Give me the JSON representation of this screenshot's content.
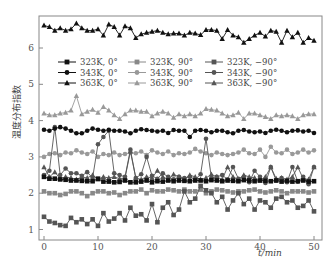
{
  "chart_data": {
    "type": "line",
    "title": "",
    "xlabel": "t/min",
    "ylabel": "温度分布指数",
    "xlim": [
      -2,
      51.5
    ],
    "ylim": [
      0.72,
      6.9
    ],
    "xticks": [
      0,
      10,
      20,
      30,
      40,
      50
    ],
    "yticks": [
      1,
      2,
      3,
      4,
      5,
      6
    ],
    "grid": false,
    "legend_position": "upper-center, 3 columns",
    "x": [
      0,
      1,
      2,
      3,
      4,
      5,
      6,
      7,
      8,
      9,
      10,
      11,
      12,
      13,
      14,
      15,
      16,
      17,
      18,
      19,
      20,
      21,
      22,
      23,
      24,
      25,
      26,
      27,
      28,
      29,
      30,
      31,
      32,
      33,
      34,
      35,
      36,
      37,
      38,
      39,
      40,
      41,
      42,
      43,
      44,
      45,
      46,
      47,
      48,
      49,
      50
    ],
    "series": [
      {
        "name": "323K, 0°",
        "color": "#111111",
        "marker": "square",
        "values": [
          2.45,
          2.4,
          2.4,
          2.38,
          2.37,
          2.35,
          2.35,
          2.34,
          2.33,
          2.33,
          2.4,
          2.32,
          2.32,
          2.3,
          2.31,
          2.35,
          2.3,
          2.3,
          2.32,
          2.35,
          2.3,
          2.33,
          2.32,
          2.35,
          2.33,
          2.35,
          2.34,
          2.33,
          2.35,
          2.35,
          2.33,
          2.36,
          2.35,
          2.33,
          2.35,
          2.34,
          2.33,
          2.36,
          2.35,
          2.33,
          2.35,
          2.34,
          2.33,
          2.35,
          2.32,
          2.34,
          2.32,
          2.33,
          2.35,
          2.32,
          2.33
        ]
      },
      {
        "name": "343K, 0°",
        "color": "#111111",
        "marker": "circle",
        "values": [
          3.75,
          3.72,
          3.78,
          3.82,
          3.78,
          3.72,
          3.65,
          3.65,
          3.72,
          3.78,
          3.75,
          3.72,
          3.75,
          3.72,
          3.72,
          3.7,
          3.65,
          3.72,
          3.76,
          3.74,
          3.72,
          3.7,
          3.72,
          3.66,
          3.74,
          3.72,
          3.72,
          3.55,
          3.72,
          3.74,
          3.72,
          3.68,
          3.72,
          3.72,
          3.68,
          3.65,
          3.72,
          3.74,
          3.7,
          3.68,
          3.7,
          3.66,
          3.72,
          3.75,
          3.72,
          3.68,
          3.72,
          3.73,
          3.7,
          3.72,
          3.66
        ]
      },
      {
        "name": "363K, 0°",
        "color": "#111111",
        "marker": "triangle",
        "values": [
          6.62,
          6.58,
          6.48,
          6.55,
          6.48,
          6.52,
          6.68,
          6.55,
          6.48,
          6.48,
          6.52,
          6.35,
          6.65,
          6.58,
          6.35,
          6.6,
          6.55,
          6.28,
          6.38,
          6.42,
          6.45,
          6.48,
          6.42,
          6.38,
          6.4,
          6.4,
          6.35,
          6.42,
          6.4,
          6.36,
          6.5,
          6.5,
          6.48,
          6.25,
          6.5,
          6.35,
          6.3,
          6.15,
          6.25,
          6.35,
          6.42,
          6.32,
          6.48,
          6.45,
          6.15,
          6.48,
          6.3,
          6.42,
          6.15,
          6.28,
          6.2
        ]
      },
      {
        "name": "323K, 90°",
        "color": "#888888",
        "marker": "square",
        "values": [
          2.05,
          2.0,
          2.0,
          1.95,
          1.98,
          2.05,
          2.05,
          2.0,
          1.92,
          2.0,
          2.05,
          2.05,
          2.0,
          2.02,
          1.95,
          2.0,
          2.05,
          2.05,
          2.1,
          2.0,
          2.08,
          2.05,
          2.05,
          2.1,
          2.08,
          2.05,
          2.1,
          2.05,
          2.05,
          2.1,
          2.0,
          2.05,
          2.1,
          2.08,
          2.05,
          2.02,
          2.05,
          2.05,
          2.08,
          2.1,
          2.05,
          2.02,
          2.05,
          2.08,
          2.05,
          2.0,
          2.05,
          2.05,
          2.05,
          2.02,
          2.05
        ]
      },
      {
        "name": "343K, 90°",
        "color": "#999999",
        "marker": "circle",
        "values": [
          3.0,
          3.08,
          3.1,
          3.05,
          3.12,
          3.1,
          3.18,
          3.12,
          3.08,
          3.15,
          3.0,
          3.08,
          3.05,
          3.12,
          3.05,
          3.08,
          3.12,
          3.1,
          3.15,
          3.05,
          3.18,
          3.12,
          3.08,
          3.15,
          3.05,
          3.1,
          3.08,
          3.12,
          3.22,
          3.15,
          3.1,
          3.05,
          3.12,
          3.08,
          3.05,
          3.08,
          3.12,
          3.2,
          3.1,
          3.08,
          3.2,
          3.0,
          3.28,
          3.12,
          3.1,
          3.2,
          3.08,
          3.12,
          3.2,
          3.12,
          3.18
        ]
      },
      {
        "name": "363K, 90°",
        "color": "#999999",
        "marker": "triangle",
        "values": [
          4.2,
          4.15,
          4.15,
          4.2,
          4.22,
          4.28,
          4.68,
          4.18,
          4.25,
          4.3,
          4.22,
          4.38,
          4.28,
          4.15,
          4.05,
          4.18,
          4.28,
          4.28,
          4.25,
          4.25,
          4.12,
          4.2,
          4.25,
          4.2,
          4.08,
          4.18,
          4.12,
          4.18,
          4.12,
          4.2,
          4.32,
          4.3,
          4.28,
          4.2,
          4.12,
          4.15,
          4.22,
          4.05,
          4.2,
          4.2,
          4.15,
          4.1,
          4.05,
          4.15,
          4.12,
          4.15,
          4.12,
          4.05,
          4.15,
          4.18,
          4.18
        ]
      },
      {
        "name": "323K, −90°",
        "color": "#555555",
        "marker": "square",
        "values": [
          1.35,
          1.22,
          1.18,
          1.12,
          1.1,
          1.32,
          1.2,
          1.28,
          1.15,
          1.28,
          1.1,
          1.45,
          1.22,
          1.3,
          1.45,
          1.25,
          1.6,
          1.38,
          1.42,
          1.25,
          1.7,
          1.2,
          1.6,
          1.75,
          1.4,
          1.55,
          2.05,
          1.75,
          1.85,
          2.2,
          2.08,
          2.0,
          1.75,
          1.9,
          1.55,
          1.8,
          2.0,
          1.7,
          1.85,
          1.55,
          1.8,
          1.75,
          1.6,
          1.85,
          1.9,
          1.75,
          1.8,
          1.6,
          1.65,
          1.8,
          1.5
        ]
      },
      {
        "name": "343K, −90°",
        "color": "#555555",
        "marker": "circle",
        "values": [
          2.5,
          2.62,
          3.82,
          2.5,
          2.68,
          2.55,
          2.55,
          2.48,
          2.58,
          2.42,
          3.35,
          3.55,
          3.72,
          2.55,
          2.5,
          2.45,
          3.2,
          2.42,
          2.52,
          3.0,
          2.48,
          2.4,
          2.55,
          2.45,
          2.38,
          2.45,
          2.42,
          2.45,
          2.38,
          2.52,
          3.5,
          2.42,
          2.45,
          2.5,
          2.38,
          2.72,
          2.4,
          2.45,
          2.3,
          2.62,
          2.45,
          2.28,
          2.72,
          2.35,
          2.42,
          2.3,
          2.72,
          2.32,
          2.45,
          2.25,
          2.72
        ]
      },
      {
        "name": "363K, −90°",
        "color": "#555555",
        "marker": "triangle",
        "values": [
          2.72,
          2.45,
          2.58,
          2.4,
          2.45,
          2.42,
          2.38,
          2.45,
          2.42,
          2.5,
          2.38,
          2.45,
          2.42,
          2.45,
          2.4,
          2.42,
          3.15,
          2.42,
          2.38,
          2.45,
          2.42,
          2.62,
          2.45,
          2.38,
          2.52,
          2.45,
          2.38,
          2.5,
          2.45,
          2.38,
          2.42,
          2.52,
          2.45,
          2.38,
          2.72,
          2.45,
          2.38,
          2.5,
          2.45,
          2.42,
          2.35,
          2.45,
          2.72,
          2.4,
          2.42,
          2.38,
          2.45,
          2.72,
          2.4,
          2.38,
          2.72
        ]
      }
    ]
  },
  "axes": {
    "xlabel": "t/min",
    "ylabel": "温度分布指数",
    "xtick_labels": [
      "0",
      "10",
      "20",
      "30",
      "40",
      "50"
    ],
    "ytick_labels": [
      "1",
      "2",
      "3",
      "4",
      "5",
      "6"
    ]
  },
  "legend": [
    {
      "label": "323K, 0°"
    },
    {
      "label": "323K, 90°"
    },
    {
      "label": "323K, −90°"
    },
    {
      "label": "343K, 0°"
    },
    {
      "label": "343K, 90°"
    },
    {
      "label": "343K, −90°"
    },
    {
      "label": "363K, 0°"
    },
    {
      "label": "363K, 90°"
    },
    {
      "label": "363K, −90°"
    }
  ]
}
